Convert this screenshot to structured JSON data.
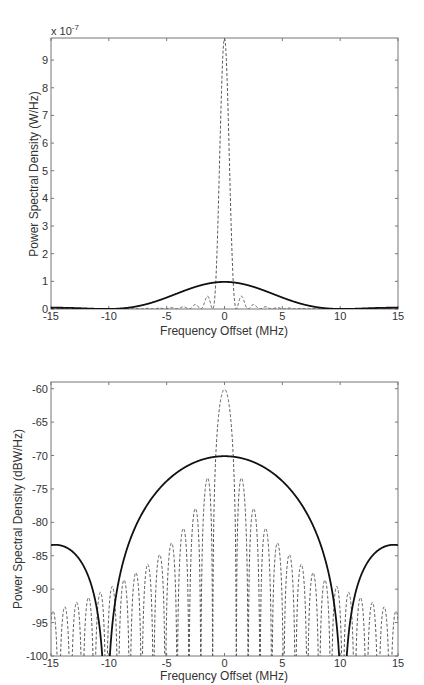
{
  "chart_data": [
    {
      "type": "line",
      "title": "",
      "xlabel": "Frequency Offset (MHz)",
      "ylabel": "Power Spectral Density (W/Hz)",
      "y_multiplier_label": "x 10",
      "y_multiplier_exp": "-7",
      "xlim": [
        -15,
        15
      ],
      "ylim": [
        0,
        9.8
      ],
      "xticks": [
        -15,
        -10,
        -5,
        0,
        5,
        10,
        15
      ],
      "yticks": [
        0,
        1,
        2,
        3,
        4,
        5,
        6,
        7,
        8,
        9
      ],
      "grid": false,
      "legend": "none",
      "series": [
        {
          "name": "wideband (solid)",
          "style": "solid",
          "sinc_width_mhz": 10.23,
          "peak": 0.98,
          "peak_value_label": "~1e-7 W/Hz"
        },
        {
          "name": "narrowband (dashed)",
          "style": "dashed",
          "sinc_width_mhz": 1.023,
          "peak": 9.78,
          "peak_value_label": "~9.8e-7 W/Hz"
        }
      ]
    },
    {
      "type": "line",
      "title": "",
      "xlabel": "Frequency Offset (MHz)",
      "ylabel": "Power Spectral Density (dBW/Hz)",
      "xlim": [
        -15,
        15
      ],
      "ylim": [
        -100,
        -59
      ],
      "xticks": [
        -15,
        -10,
        -5,
        0,
        5,
        10,
        15
      ],
      "yticks": [
        -100,
        -95,
        -90,
        -85,
        -80,
        -75,
        -70,
        -65,
        -60
      ],
      "grid": false,
      "legend": "none",
      "series": [
        {
          "name": "wideband (solid)",
          "style": "solid",
          "sinc_width_mhz": 10.23,
          "peak_db": -70.1,
          "sidelobe_at_15mhz_db": -83.3
        },
        {
          "name": "narrowband (dashed)",
          "style": "dashed",
          "sinc_width_mhz": 1.023,
          "peak_db": -60.1
        }
      ]
    }
  ]
}
